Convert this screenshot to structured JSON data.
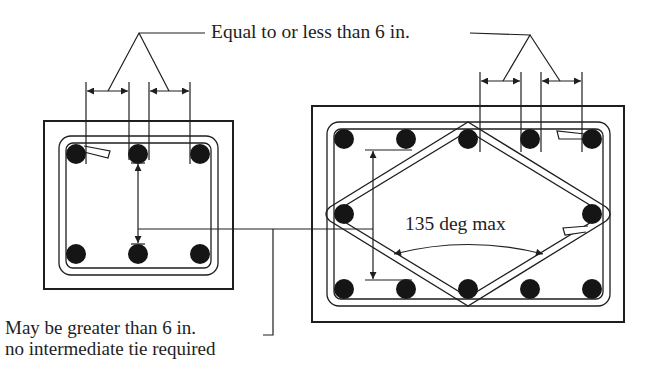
{
  "diagram": {
    "labels": {
      "equal_or_less": "Equal to or less than 6 in.",
      "angle_max": "135 deg max",
      "may_be_greater": "May be greater than 6 in.",
      "no_intermediate": "no intermediate tie required"
    },
    "colors": {
      "line": "#1e1e1e",
      "bar_fill": "#151515",
      "background": "#ffffff"
    },
    "left_column": {
      "name": "rectangular column, 6 bars",
      "bar_count": 6,
      "bars": [
        {
          "x": 76,
          "y": 154
        },
        {
          "x": 138,
          "y": 154
        },
        {
          "x": 200,
          "y": 154
        },
        {
          "x": 76,
          "y": 254
        },
        {
          "x": 138,
          "y": 254
        },
        {
          "x": 200,
          "y": 254
        }
      ]
    },
    "right_column": {
      "name": "rectangular column, 12 bars with diamond tie",
      "bar_count": 12,
      "bars": [
        {
          "x": 344,
          "y": 139
        },
        {
          "x": 406,
          "y": 139
        },
        {
          "x": 468,
          "y": 139
        },
        {
          "x": 530,
          "y": 139
        },
        {
          "x": 592,
          "y": 139
        },
        {
          "x": 344,
          "y": 214
        },
        {
          "x": 592,
          "y": 214
        },
        {
          "x": 344,
          "y": 289
        },
        {
          "x": 406,
          "y": 289
        },
        {
          "x": 468,
          "y": 289
        },
        {
          "x": 530,
          "y": 289
        },
        {
          "x": 592,
          "y": 289
        }
      ]
    }
  }
}
